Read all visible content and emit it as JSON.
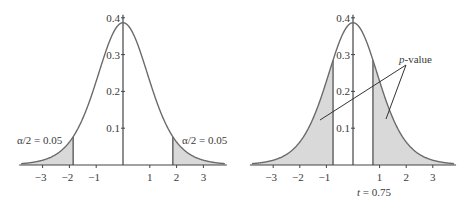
{
  "chart_data": [
    {
      "type": "area",
      "title": "",
      "description": "Student t density curve with two-tailed rejection regions shaded",
      "xlabel": "",
      "ylabel": "",
      "xlim": [
        -3.8,
        3.8
      ],
      "ylim": [
        0,
        0.4
      ],
      "x_ticks": [
        -3,
        -2,
        -1,
        1,
        2,
        3
      ],
      "x_tick_labels": [
        "−3",
        "−2",
        "−1",
        "1",
        "2",
        "3"
      ],
      "y_ticks": [
        0.1,
        0.2,
        0.3,
        0.4
      ],
      "y_tick_labels": [
        "0.1",
        "0.2",
        "0.3",
        "0.4"
      ],
      "peak_density": 0.39,
      "critical_values": [
        -1.86,
        1.86
      ],
      "shaded_regions": [
        {
          "from": -3.8,
          "to": -1.86,
          "label": "α/2 = 0.05"
        },
        {
          "from": 1.86,
          "to": 3.8,
          "label": "α/2 = 0.05"
        }
      ],
      "annotations": {
        "left_tail": "α/2 = 0.05",
        "right_tail": "α/2 = 0.05"
      },
      "grid": false,
      "color_fill": "#d9d9d9",
      "color_curve": "#6b6b6b"
    },
    {
      "type": "area",
      "title": "",
      "description": "Student t density curve with p-value regions shaded beyond |t| = 0.75",
      "xlabel": "",
      "ylabel": "",
      "xlim": [
        -3.8,
        3.8
      ],
      "ylim": [
        0,
        0.4
      ],
      "x_ticks": [
        -3,
        -2,
        -1,
        1,
        2,
        3
      ],
      "x_tick_labels": [
        "−3",
        "−2",
        "−1",
        "1",
        "2",
        "3"
      ],
      "y_ticks": [
        0.1,
        0.2,
        0.3,
        0.4
      ],
      "y_tick_labels": [
        "0.1",
        "0.2",
        "0.3",
        "0.4"
      ],
      "peak_density": 0.39,
      "test_statistic": 0.75,
      "shaded_regions": [
        {
          "from": -3.8,
          "to": -0.75,
          "label": "p-value"
        },
        {
          "from": 0.75,
          "to": 3.8,
          "label": "p-value"
        }
      ],
      "annotations": {
        "p_value_label_italic": "p",
        "p_value_label_rest": "-value",
        "t_label_italic": "t",
        "t_label_rest": " = 0.75"
      },
      "grid": false,
      "color_fill": "#d9d9d9",
      "color_curve": "#6b6b6b"
    }
  ]
}
